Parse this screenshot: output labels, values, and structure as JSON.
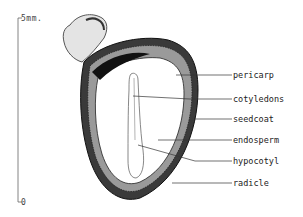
{
  "scale": {
    "top_label": "5mm.",
    "bottom_label": "0"
  },
  "labels": [
    {
      "text": "pericarp",
      "y": 75
    },
    {
      "text": "cotyledons",
      "y": 99
    },
    {
      "text": "seedcoat",
      "y": 119
    },
    {
      "text": "endosperm",
      "y": 140
    },
    {
      "text": "hypocotyl",
      "y": 161
    },
    {
      "text": "radicle",
      "y": 183
    }
  ],
  "colors": {
    "ink": "#222222",
    "paper": "#ffffff"
  }
}
